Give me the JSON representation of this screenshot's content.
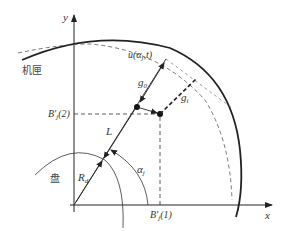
{
  "diagram": {
    "axes": {
      "x_label": "x",
      "y_label": "y"
    },
    "labels": {
      "casing": "机匣",
      "disk": "盘",
      "displacement_main": "u(α",
      "displacement_sub": "j",
      "displacement_tail": ",t)",
      "g0_main": "g",
      "g0_sub": "0",
      "gi_main": "g",
      "gi_sub": "i",
      "L": "L",
      "Rd_main": "R",
      "Rd_sub": "d",
      "alpha_main": "α",
      "alpha_sub": "j",
      "b2_main": "B′",
      "b2_sub": "j",
      "b2_tail": "(2)",
      "b1_main": "B′",
      "b1_sub": "j",
      "b1_tail": "(1)"
    },
    "colors": {
      "line": "#222222",
      "dashed": "#555555",
      "text": "#333333"
    }
  }
}
